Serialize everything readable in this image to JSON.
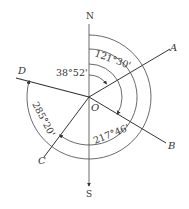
{
  "diagram": {
    "center_label": "O",
    "axis_labels": {
      "north": "N",
      "south": "S"
    },
    "rays": [
      {
        "label": "A"
      },
      {
        "label": "B"
      },
      {
        "label": "C"
      },
      {
        "label": "D"
      }
    ],
    "angles": [
      {
        "label": "38°52'",
        "from": "N",
        "to": "A"
      },
      {
        "label": "121°30'",
        "from": "N",
        "to": "B"
      },
      {
        "label": "217°46'",
        "from": "N",
        "to": "C"
      },
      {
        "label": "285°20'",
        "from": "N",
        "to": "D"
      }
    ],
    "colors": {
      "line": "#333333",
      "background": "#ffffff"
    }
  }
}
